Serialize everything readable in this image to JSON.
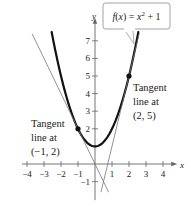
{
  "chart_data": {
    "type": "line",
    "title": "",
    "xlabel": "x",
    "ylabel": "y",
    "xlim": [
      -4.3,
      4.6
    ],
    "ylim": [
      -1.6,
      7.8
    ],
    "x_ticks": [
      -4,
      -3,
      -2,
      -1,
      1,
      2,
      3,
      4
    ],
    "x_tick_labels": [
      "−4",
      "−3",
      "−2",
      "−1",
      "1",
      "2",
      "3",
      "4"
    ],
    "y_ticks": [
      -1,
      1,
      2,
      3,
      4,
      5,
      6,
      7
    ],
    "y_tick_labels": [
      "−1",
      "",
      "2",
      "3",
      "4",
      "5",
      "6",
      "7"
    ],
    "grid": false,
    "series": [
      {
        "name": "f(x) = x^2 + 1",
        "label": "f(x) = x² + 1",
        "kind": "curve",
        "style": "thick",
        "color": "#111111",
        "x": [
          -2.55,
          -2,
          -1.5,
          -1,
          -0.5,
          0,
          0.5,
          1,
          1.5,
          2,
          2.55
        ],
        "y": [
          7.5,
          5,
          3.25,
          2,
          1.25,
          1,
          1.25,
          2,
          3.25,
          5,
          7.5
        ]
      },
      {
        "name": "Tangent line at (-1, 2)",
        "kind": "line",
        "equation": "y = -2x",
        "color": "#777777",
        "x": [
          -3.7,
          0.8
        ],
        "y": [
          7.4,
          -1.6
        ]
      },
      {
        "name": "Tangent line at (2, 5)",
        "kind": "line",
        "equation": "y = 4x - 3",
        "color": "#777777",
        "x": [
          0.35,
          2.6
        ],
        "y": [
          -1.6,
          7.4
        ]
      }
    ],
    "points": [
      {
        "x": -1,
        "y": 2,
        "label": "(−1, 2)"
      },
      {
        "x": 2,
        "y": 5,
        "label": "(2, 5)"
      }
    ],
    "annotations": [
      {
        "text_lines": [
          "Tangent",
          "line at",
          "(−1, 2)"
        ],
        "x": -3.8,
        "y": 2.2
      },
      {
        "text_lines": [
          "Tangent",
          "line at",
          "(2, 5)"
        ],
        "x": 2.25,
        "y": 4.4
      },
      {
        "text": "f(x) = x² + 1",
        "callout": true,
        "x": 0.6,
        "y": 8.2
      }
    ]
  },
  "labels": {
    "func_label": "f(x) = x² + 1",
    "ann_left": [
      "Tangent",
      "line at",
      "(−1, 2)"
    ],
    "ann_right": [
      "Tangent",
      "line at",
      "(2, 5)"
    ],
    "x_axis_name": "x",
    "y_axis_name": "y"
  }
}
